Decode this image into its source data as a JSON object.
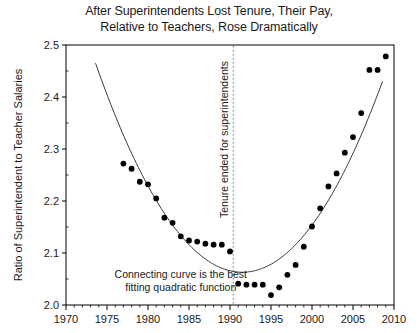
{
  "chart_data": {
    "type": "scatter",
    "title": "After Superintendents Lost Tenure, Their Pay, Relative to Teachers, Rose Dramatically",
    "title_line1": "After Superintendents Lost Tenure, Their Pay,",
    "title_line2": "Relative to Teachers, Rose Dramatically",
    "xlabel": "",
    "ylabel": "Ratio of Superintendent to Teacher Salaries",
    "xlim": [
      1970,
      2010
    ],
    "ylim": [
      2.0,
      2.5
    ],
    "xticks": [
      1970,
      1975,
      1980,
      1985,
      1990,
      1995,
      2000,
      2005,
      2010
    ],
    "xtick_labels": [
      "1970",
      "1975",
      "1980",
      "1985",
      "1990",
      "1995",
      "2000",
      "2005",
      "2010"
    ],
    "minor_xtick_interval": 1,
    "yticks": [
      2.0,
      2.1,
      2.2,
      2.3,
      2.4,
      2.5
    ],
    "ytick_labels": [
      "2.0",
      "2.1",
      "2.2",
      "2.3",
      "2.4",
      "2.5"
    ],
    "grid": false,
    "legend": null,
    "marker_color": "#000000",
    "curve_color": "#3c3c3c",
    "axis_color": "#000000",
    "background_color": "#ffffff",
    "x": [
      1977,
      1978,
      1979,
      1980,
      1981,
      1982,
      1983,
      1984,
      1985,
      1986,
      1987,
      1988,
      1989,
      1990,
      1991,
      1992,
      1993,
      1994,
      1995,
      1996,
      1997,
      1998,
      1999,
      2000,
      2001,
      2002,
      2003,
      2004,
      2005,
      2006,
      2007,
      2008,
      2009
    ],
    "values": [
      2.272,
      2.262,
      2.237,
      2.232,
      2.205,
      2.168,
      2.158,
      2.132,
      2.124,
      2.122,
      2.118,
      2.116,
      2.116,
      2.103,
      2.041,
      2.039,
      2.039,
      2.039,
      2.019,
      2.034,
      2.058,
      2.077,
      2.112,
      2.151,
      2.186,
      2.228,
      2.253,
      2.293,
      2.323,
      2.369,
      2.452,
      2.452,
      2.478
    ],
    "series": [
      {
        "name": "Ratio of superintendent to teacher salaries",
        "marker": "filled-circle",
        "points": [
          {
            "year": 1977,
            "ratio": 2.272
          },
          {
            "year": 1978,
            "ratio": 2.262
          },
          {
            "year": 1979,
            "ratio": 2.237
          },
          {
            "year": 1980,
            "ratio": 2.232
          },
          {
            "year": 1981,
            "ratio": 2.205
          },
          {
            "year": 1982,
            "ratio": 2.168
          },
          {
            "year": 1983,
            "ratio": 2.158
          },
          {
            "year": 1984,
            "ratio": 2.132
          },
          {
            "year": 1985,
            "ratio": 2.124
          },
          {
            "year": 1986,
            "ratio": 2.122
          },
          {
            "year": 1987,
            "ratio": 2.118
          },
          {
            "year": 1988,
            "ratio": 2.116
          },
          {
            "year": 1989,
            "ratio": 2.116
          },
          {
            "year": 1990,
            "ratio": 2.103
          },
          {
            "year": 1991,
            "ratio": 2.041
          },
          {
            "year": 1992,
            "ratio": 2.039
          },
          {
            "year": 1993,
            "ratio": 2.039
          },
          {
            "year": 1994,
            "ratio": 2.039
          },
          {
            "year": 1995,
            "ratio": 2.019
          },
          {
            "year": 1996,
            "ratio": 2.034
          },
          {
            "year": 1997,
            "ratio": 2.058
          },
          {
            "year": 1998,
            "ratio": 2.077
          },
          {
            "year": 1999,
            "ratio": 2.112
          },
          {
            "year": 2000,
            "ratio": 2.151
          },
          {
            "year": 2001,
            "ratio": 2.186
          },
          {
            "year": 2002,
            "ratio": 2.228
          },
          {
            "year": 2003,
            "ratio": 2.253
          },
          {
            "year": 2004,
            "ratio": 2.293
          },
          {
            "year": 2005,
            "ratio": 2.323
          },
          {
            "year": 2006,
            "ratio": 2.369
          },
          {
            "year": 2007,
            "ratio": 2.452
          },
          {
            "year": 2008,
            "ratio": 2.452
          },
          {
            "year": 2009,
            "ratio": 2.478
          }
        ]
      }
    ],
    "fit_curve": {
      "name": "best fitting quadratic function",
      "type": "quadratic",
      "vertex_year": 1991.5,
      "vertex_ratio": 2.063,
      "curvature_per_year_sq": 0.001255,
      "x_start": 1973.6,
      "x_end": 2008.6
    },
    "annotations": [
      {
        "name": "curve-note",
        "line1": "Connecting curve is the best",
        "line2": "fitting quadratic function",
        "x": 1984.0,
        "y": 2.052
      },
      {
        "name": "tenure-event",
        "text": "Tenure ended for superintendents",
        "orientation": "vertical",
        "x": 1990.4
      }
    ],
    "reference_lines": [
      {
        "name": "tenure-ended-line",
        "orientation": "vertical",
        "x": 1990.4,
        "style": "dotted"
      }
    ]
  }
}
